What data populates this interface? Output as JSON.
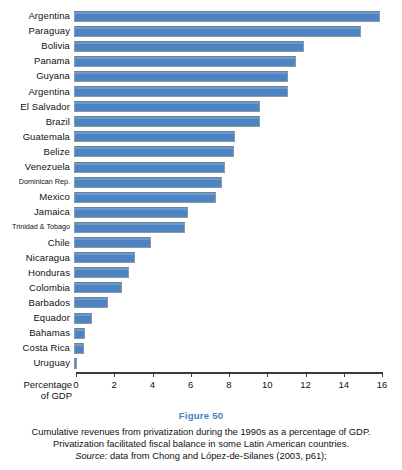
{
  "chart_data": {
    "type": "bar",
    "orientation": "horizontal",
    "title": "Cumulative revenues from privatization during the 1990s as a percentage of GDP",
    "xlabel": "Percentage of GDP",
    "ylabel": "",
    "xlim": [
      0,
      16
    ],
    "xticks": [
      0,
      2,
      4,
      6,
      8,
      10,
      12,
      14,
      16
    ],
    "grid": false,
    "legend": null,
    "bar_color": "#4d84c4",
    "categories": [
      "Argentina",
      "Paraguay",
      "Bolivia",
      "Panama",
      "Guyana",
      "Argentina",
      "El Salvador",
      "Brazil",
      "Guatemala",
      "Belize",
      "Venezuela",
      "Dominican Rep.",
      "Mexico",
      "Jamaica",
      "Trinidad & Tobago",
      "Chile",
      "Nicaragua",
      "Honduras",
      "Colombia",
      "Barbados",
      "Equador",
      "Bahamas",
      "Costa Rica",
      "Uruguay"
    ],
    "values": [
      16.0,
      15.0,
      12.0,
      11.6,
      11.2,
      11.2,
      9.7,
      9.7,
      8.4,
      8.35,
      7.9,
      7.75,
      7.4,
      5.95,
      5.8,
      4.0,
      3.2,
      2.85,
      2.5,
      1.8,
      0.95,
      0.55,
      0.5,
      0.15
    ],
    "small_label_categories": [
      "Dominican Rep.",
      "Trinidad & Tobago"
    ]
  },
  "caption": {
    "figure_number": "Figure 50",
    "text": "Cumulative revenues from privatization during the 1990s as a percentage of GDP. Privatization facilitated fiscal balance in some Latin American countries.",
    "source_word": "Source:",
    "source_text": " data from Chong and López-de-Silanes (2003, p61);"
  },
  "colors": {
    "bar": "#4d84c4",
    "bar_border": "#8d9aa6",
    "figure_number": "#3f7fc1",
    "axis": "#3a3a3a",
    "text": "#111111",
    "background": "#ffffff"
  }
}
